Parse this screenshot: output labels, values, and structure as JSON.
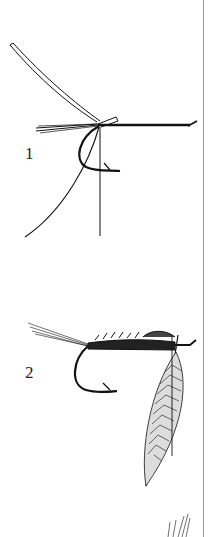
{
  "figure": {
    "steps": [
      {
        "number": "1",
        "content": "hook with tail fibers, ribbing strip and thread tied in at bend"
      },
      {
        "number": "2",
        "content": "body wrapped, wing case formed, hackle feather tied in at eye"
      }
    ],
    "colors": {
      "ink": "#111111",
      "background": "#ffffff",
      "page_edge": "#9a9a9a"
    }
  }
}
